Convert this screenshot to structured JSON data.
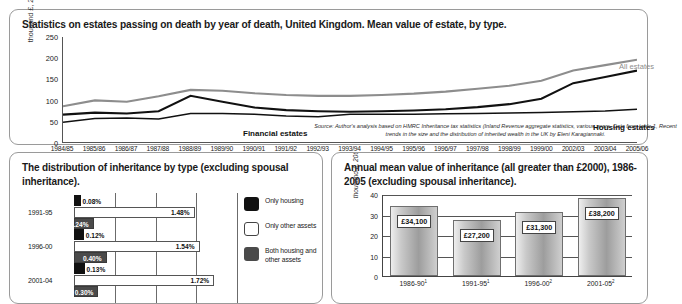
{
  "top_panel": {
    "title": "Statistics on estates passing on death by year of death, United Kingdom. Mean value of estate, by type.",
    "source_note": "Source: Author's analysis based on HMRC Inheritance tax statistics (Inland Revenue aggregate statistics, various years. Data from table 1, Recent trends in the size and the distribution of inherited wealth in the UK by Eleni Karagiannaki."
  },
  "bottom_left_panel": {
    "title": "The distribution of inheritance by type (excluding spousal inheritance).",
    "legend": [
      {
        "key": "only-housing",
        "label": "Only housing",
        "color": "#111111"
      },
      {
        "key": "only-other-assets",
        "label": "Only other assets",
        "color": "#ffffff"
      },
      {
        "key": "both-housing-and-other",
        "label": "Both housing and other assets",
        "color": "#4a4a4a"
      }
    ]
  },
  "bottom_right_panel": {
    "title": "Annual mean value of inheritance (all greater than £2000), 1986-2005 (excluding spousal inheritance)."
  },
  "chart_data": [
    {
      "id": "mean-value-of-estate",
      "type": "line",
      "title": "Statistics on estates passing on death by year of death, United Kingdom. Mean value of estate, by type.",
      "xlabel": "",
      "ylabel": "thousand £, 2005 prices",
      "ylim": [
        0,
        250
      ],
      "yticks": [
        0,
        50,
        100,
        150,
        200,
        250
      ],
      "grid": false,
      "legend_position": "inline-annotations",
      "categories": [
        "1984/85",
        "1985/86",
        "1986/87",
        "1987/88",
        "1988/89",
        "1989/90",
        "1990/91",
        "1991/92",
        "1992/93",
        "1993/94",
        "1994/95",
        "1995/96",
        "1996/97",
        "1997/98",
        "1998/99",
        "1999/00",
        "2002/03",
        "2003/04",
        "2005/06"
      ],
      "series": [
        {
          "name": "All estates",
          "color": "#8d8d8d",
          "values": [
            85,
            99,
            96,
            109,
            124,
            122,
            116,
            112,
            110,
            110,
            112,
            115,
            120,
            127,
            134,
            146,
            170,
            183,
            196
          ]
        },
        {
          "name": "Housing estates",
          "color": "#111111",
          "values": [
            65,
            70,
            68,
            73,
            110,
            96,
            82,
            76,
            73,
            72,
            73,
            75,
            78,
            83,
            90,
            103,
            140,
            155,
            170
          ]
        },
        {
          "name": "Financial estates",
          "color": "#111111",
          "values": [
            47,
            56,
            57,
            55,
            68,
            68,
            66,
            62,
            60,
            66,
            66,
            66,
            67,
            68,
            69,
            70,
            72,
            74,
            78
          ]
        }
      ]
    },
    {
      "id": "distribution-of-inheritance-by-type",
      "type": "bar",
      "orientation": "horizontal",
      "title": "The distribution of inheritance by type (excluding spousal inheritance).",
      "xlabel": "",
      "ylabel": "",
      "xlim": [
        0,
        2.0
      ],
      "grid": true,
      "gridlines": [
        0.5,
        1.0,
        1.5,
        2.0
      ],
      "categories": [
        "1991-95",
        "1996-00",
        "2001-04"
      ],
      "series": [
        {
          "name": "Only housing",
          "key": "only-housing",
          "values": [
            0.08,
            0.12,
            0.13
          ],
          "labels": [
            "0.08%",
            "0.12%",
            "0.13%"
          ]
        },
        {
          "name": "Only other assets",
          "key": "only-other-assets",
          "values": [
            1.48,
            1.54,
            1.72
          ],
          "labels": [
            "1.48%",
            "1.54%",
            "1.72%"
          ]
        },
        {
          "name": "Both housing and other assets",
          "key": "both-housing-and-other",
          "values": [
            0.24,
            0.4,
            0.3
          ],
          "labels": [
            "0.24%",
            "0.40%",
            "0.30%"
          ]
        }
      ]
    },
    {
      "id": "annual-mean-value-of-inheritance",
      "type": "bar",
      "orientation": "vertical",
      "title": "Annual mean value of inheritance (all greater than £2000), 1986-2005 (excluding spousal inheritance).",
      "xlabel": "",
      "ylabel": "thousand £, 2005 prices",
      "ylim": [
        0,
        40
      ],
      "yticks": [
        0,
        10,
        20,
        30,
        40
      ],
      "grid": true,
      "categories": [
        "1986-90",
        "1991-95",
        "1996-00",
        "2001-05"
      ],
      "category_footnotes": [
        "1",
        "1",
        "2",
        "2"
      ],
      "values": [
        34.1,
        27.2,
        31.3,
        38.2
      ],
      "value_labels": [
        "£34,100",
        "£27,200",
        "£31,300",
        "£38,200"
      ]
    }
  ]
}
